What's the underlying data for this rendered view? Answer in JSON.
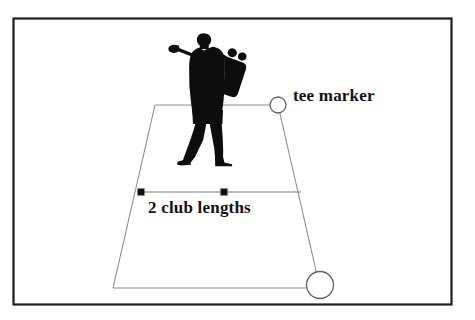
{
  "figure": {
    "title_text_elements": [
      {
        "id": "tee_marker",
        "text": "tee marker"
      },
      {
        "id": "club_lengths",
        "text": "2 club lengths"
      }
    ],
    "labels": {
      "tee_marker": "tee marker",
      "club_lengths": "2 club lengths"
    },
    "colors": {
      "background": "#ffffff",
      "frame_border": "#1d1d1d",
      "diagram_outline": "#8a8a8a",
      "silhouette": "#0d0d0d",
      "measure_line": "#7a7a7a",
      "marker_dot": "#111111",
      "text": "#111111"
    },
    "icons": {
      "tee_marker_circle": "circle-outline-icon",
      "ball_circle": "circle-outline-icon",
      "golfer": "golfer-silhouette-icon",
      "measure_dot_left": "square-dot-icon",
      "measure_dot_mid": "square-dot-icon"
    },
    "geometry": {
      "frame": {
        "x": 13,
        "y": 18,
        "width": 439,
        "height": 287
      },
      "teeing_ground_trapezoid": {
        "top_left": [
          155,
          105
        ],
        "top_right": [
          278,
          105
        ],
        "bottom_right": [
          320,
          288
        ],
        "bottom_left": [
          113,
          288
        ]
      },
      "tee_marker_circle": {
        "cx": 278,
        "cy": 105,
        "r": 8
      },
      "ball_circle": {
        "cx": 320,
        "cy": 285,
        "r": 13
      },
      "measure_line": {
        "x1": 140,
        "x2": 300,
        "y": 192
      },
      "measure_dots": [
        {
          "cx": 141,
          "cy": 192
        },
        {
          "cx": 224,
          "cy": 192
        }
      ]
    }
  }
}
